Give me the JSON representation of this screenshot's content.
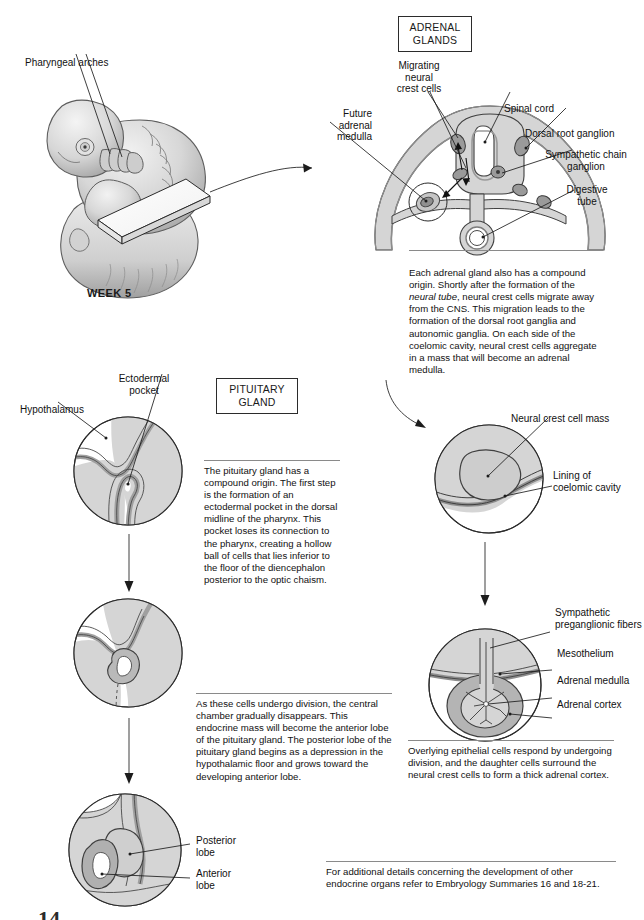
{
  "page": {
    "background": "#ffffff",
    "width": 644,
    "height": 920
  },
  "embryo": {
    "label_pharyngeal_arches": "Pharyngeal arches",
    "week_label": "WEEK 5"
  },
  "adrenal": {
    "section_title": "ADRENAL\nGLANDS",
    "labels": {
      "migrating_neural_crest_cells": "Migrating\nneural\ncrest cells",
      "spinal_cord": "Spinal cord",
      "dorsal_root_ganglion": "Dorsal root ganglion",
      "sympathetic_chain_ganglion": "Sympathetic chain\nganglion",
      "digestive_tube": "Digestive\ntube",
      "future_adrenal_medulla": "Future\nadrenal\nmedulla",
      "neural_crest_cell_mass": "Neural crest cell mass",
      "lining_of_coelomic_cavity": "Lining of\ncoelomic cavity",
      "sympathetic_preganglionic_fibers": "Sympathetic\npreganglionic fibers",
      "mesothelium": "Mesothelium",
      "adrenal_medulla": "Adrenal medulla",
      "adrenal_cortex": "Adrenal cortex"
    },
    "caption_1_pre": "Each adrenal gland also has a compound origin. Shortly after the formation of the ",
    "caption_1_italic": "neural tube",
    "caption_1_post": ", neural crest cells migrate away from the CNS. This migration leads to the formation of the dorsal root ganglia and autonomic ganglia. On each side of the coelomic cavity, neural crest cells aggregate in a mass that will become an adrenal medulla.",
    "caption_2": "Overlying epithelial cells respond by undergoing division, and the daughter cells surround the neural crest cells to form a thick adrenal cortex."
  },
  "pituitary": {
    "section_title": "PITUITARY\nGLAND",
    "labels": {
      "hypothalamus": "Hypothalamus",
      "ectodermal_pocket": "Ectodermal\npocket",
      "posterior_lobe": "Posterior\nlobe",
      "anterior_lobe": "Anterior\nlobe"
    },
    "caption_1": "The pituitary gland has a compound origin. The first step is the formation of an ectodermal pocket in the dorsal midline of the pharynx. This pocket loses its connection to the pharynx, creating a hollow ball of cells that lies inferior to the floor of the diencephalon posterior to the optic chaism.",
    "caption_2": "As these cells undergo division, the central chamber gradually disappears. This endocrine mass will become the anterior lobe of the pituitary gland. The posterior lobe of the pituitary gland begins as a depression in the hypothalamic floor and grows toward the developing anterior lobe."
  },
  "footer": {
    "note": "For additional details concerning the development of other endocrine organs refer to Embryology Summaries 16 and 18-21."
  },
  "palette": {
    "ink": "#1c1c1c",
    "tissue_light": "#d9d9d9",
    "tissue_mid": "#c0c0c0",
    "tissue_dark": "#9e9e9e",
    "tissue_darker": "#858585",
    "white": "#ffffff"
  }
}
